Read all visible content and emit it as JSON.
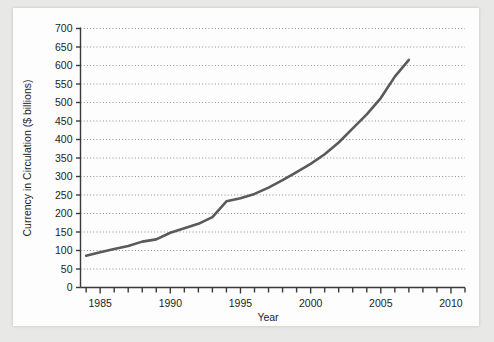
{
  "chart_data": {
    "type": "line",
    "title": "",
    "xlabel": "Year",
    "ylabel": "Currency in Circulation ($ billions)",
    "xlim": [
      1983.6,
      2011.0
    ],
    "ylim": [
      0,
      700
    ],
    "grid": true,
    "grid_style": "dotted-horizontal",
    "legend": "none",
    "line_color": "#5a5a5a",
    "x_ticks_major": [
      1985,
      1990,
      1995,
      2000,
      2005,
      2010
    ],
    "x_tick_labels": [
      "1985",
      "1990",
      "1995",
      "2000",
      "2005",
      "2010"
    ],
    "x_minor_tick_interval": 1,
    "y_ticks": [
      0,
      50,
      100,
      150,
      200,
      250,
      300,
      350,
      400,
      450,
      500,
      550,
      600,
      650,
      700
    ],
    "y_tick_labels": [
      "0",
      "50",
      "100",
      "150",
      "200",
      "250",
      "300",
      "350",
      "400",
      "450",
      "500",
      "550",
      "600",
      "650",
      "700"
    ],
    "series": [
      {
        "name": "Currency in Circulation",
        "x": [
          1984,
          1985,
          1986,
          1987,
          1988,
          1989,
          1990,
          1991,
          1992,
          1993,
          1994,
          1995,
          1996,
          1997,
          1998,
          1999,
          2000,
          2001,
          2002,
          2003,
          2004,
          2005,
          2006,
          2007
        ],
        "values": [
          86,
          95,
          104,
          112,
          124,
          130,
          148,
          160,
          172,
          190,
          233,
          241,
          253,
          270,
          290,
          312,
          334,
          360,
          392,
          430,
          468,
          512,
          570,
          615
        ]
      }
    ]
  },
  "axis": {
    "y_title": "Currency in Circulation ($ billions)",
    "x_title": "Year"
  }
}
